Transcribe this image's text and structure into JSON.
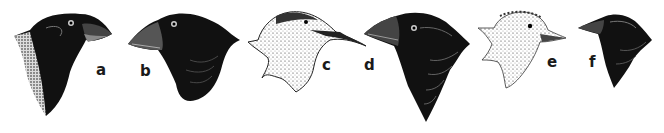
{
  "figure": {
    "colors": {
      "ink": "#111111",
      "paper": "#ffffff",
      "light_ink": "#555555"
    },
    "heads": [
      {
        "id": "a",
        "label": "a",
        "plumage": "dark",
        "beak": "large crushing"
      },
      {
        "id": "b",
        "label": "b",
        "plumage": "dark",
        "beak": "large conical"
      },
      {
        "id": "c",
        "label": "c",
        "plumage": "light speckled",
        "beak": "long slender probing"
      },
      {
        "id": "d",
        "label": "d",
        "plumage": "dark",
        "beak": "large conical"
      },
      {
        "id": "e",
        "label": "e",
        "plumage": "light speckled",
        "beak": "slender pointed"
      },
      {
        "id": "f",
        "label": "f",
        "plumage": "dark",
        "beak": "small pointed"
      }
    ]
  }
}
